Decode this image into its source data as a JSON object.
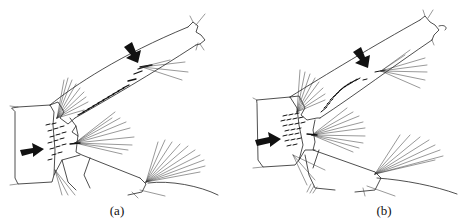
{
  "figure": {
    "panels": [
      {
        "id": "a",
        "label": "(a)",
        "arrows": 2,
        "description": "appendage line drawing with arrows indicating setae rows"
      },
      {
        "id": "b",
        "label": "(b)",
        "arrows": 2,
        "description": "appendage line drawing with arrows indicating denser setae rows"
      }
    ],
    "colors": {
      "ink": "#111111",
      "background": "#ffffff"
    }
  }
}
